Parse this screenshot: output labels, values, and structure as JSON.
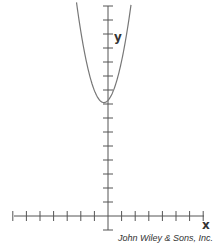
{
  "figure": {
    "x_axis_label": "x",
    "y_axis_label": "y",
    "credit": "John Wiley & Sons, Inc.",
    "colors": {
      "axis": "#555555",
      "curve": "#777777",
      "text": "#333333"
    }
  },
  "chart_data": {
    "type": "line",
    "title": "",
    "xlabel": "x",
    "ylabel": "y",
    "grid": false,
    "x_ticks_left_of_origin": 7,
    "x_ticks_right_of_origin": 7,
    "y_ticks_above_origin": 15,
    "y_ticks_below_origin": 1,
    "tick_labels": [],
    "series": [
      {
        "name": "parabola",
        "description": "upward-opening parabola, vertex slightly left of the y-axis at about y = 8 tick units",
        "vertex": [
          -0.3,
          8.1
        ],
        "points": [
          [
            -2.2,
            15.5
          ],
          [
            -1.5,
            12
          ],
          [
            -1,
            10
          ],
          [
            -0.3,
            8.1
          ],
          [
            0.5,
            9
          ],
          [
            1,
            11
          ],
          [
            1.5,
            13.5
          ],
          [
            1.9,
            15.5
          ]
        ]
      }
    ]
  }
}
